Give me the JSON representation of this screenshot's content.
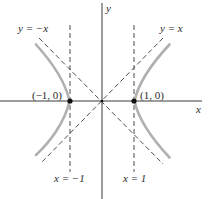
{
  "diagram": {
    "type": "hyperbola-graph",
    "equation_shown": "x^2 - y^2 = 1",
    "axes": {
      "x_label": "x",
      "y_label": "y"
    },
    "asymptotes": [
      {
        "label": "y = −x",
        "name": "y-equals-neg-x"
      },
      {
        "label": "y = x",
        "name": "y-equals-x"
      }
    ],
    "vertical_lines": [
      {
        "label": "x = −1",
        "name": "x-equals-neg-1"
      },
      {
        "label": "x = 1",
        "name": "x-equals-1"
      }
    ],
    "vertices": [
      {
        "label": "(−1, 0)",
        "x": -1,
        "y": 0
      },
      {
        "label": "(1, 0)",
        "x": 1,
        "y": 0
      }
    ],
    "colors": {
      "curve": "#b0b0b0",
      "axes": "#3a3a3a",
      "dashed": "#3a3a3a",
      "points": "#111111"
    }
  }
}
